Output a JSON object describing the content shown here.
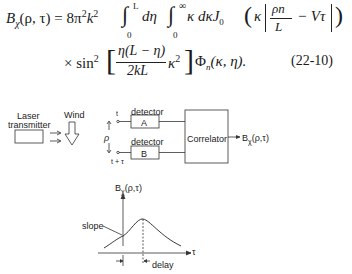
{
  "equation": {
    "line1_lhs": "B",
    "line1_lhs_sub": "χ",
    "line1_lhs_args": "(ρ, τ) = 8π",
    "line1_k": "k",
    "line1_rest": "dη",
    "line1_rest2": "κ dκJ",
    "line1_j_sub": "0",
    "line1_tail_open": "κ",
    "line1_frac_num": "ρn",
    "line1_frac_den": "L",
    "line1_tail": "− Vτ",
    "int1_upper": "L",
    "int1_lower": "0",
    "int2_upper": "∞",
    "int2_lower": "0",
    "line2_prefix": "× sin",
    "line2_sq": "2",
    "line2_frac_num": "η(L − η)",
    "line2_frac_den": "2kL",
    "line2_kappa": "κ",
    "line2_phi": "Φ",
    "line2_phi_sub": "n",
    "line2_phi_args": "(κ, η).",
    "number": "(22-10)"
  },
  "diagram": {
    "laser_label_line1": "Laser",
    "laser_label_line2": "transmitter",
    "wind_label": "Wind",
    "detector_a_label": "detector",
    "detector_a_box": "A",
    "detector_b_label": "detector",
    "detector_b_box": "B",
    "time_a": "t",
    "time_b": "t + τ",
    "separation": "ρ",
    "correlator": "Correlator",
    "output": "B",
    "output_sub": "χ",
    "output_args": "(ρ,τ)"
  },
  "plot": {
    "ylabel": "B",
    "ylabel_sub": "χ",
    "ylabel_args": "(ρ,τ)",
    "xlabel": "τ",
    "slope_label": "slope",
    "delay_label": "delay"
  }
}
